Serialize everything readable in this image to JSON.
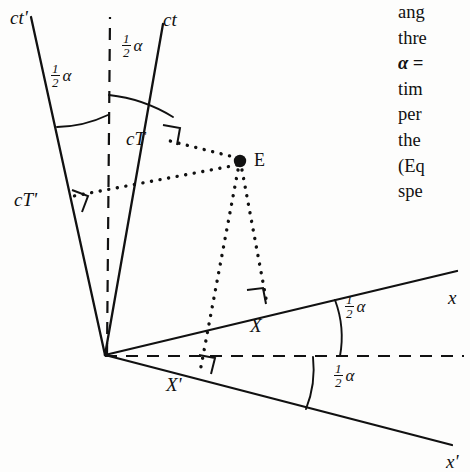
{
  "figure": {
    "name": "minkowski-spacetime-diagram",
    "ink_color": "#111111",
    "background_color": "#fdfdfc"
  },
  "axes": [
    {
      "id": "ct-prime",
      "label": "ct'",
      "x": 18,
      "y": 20
    },
    {
      "id": "ct",
      "label": "ct",
      "x": 168,
      "y": 22
    },
    {
      "id": "x",
      "label": "x",
      "x": 449,
      "y": 299
    },
    {
      "id": "x-prime",
      "label": "x'",
      "x": 449,
      "y": 463
    }
  ],
  "segments": [
    {
      "id": "cT",
      "label": "cT",
      "x": 128,
      "y": 139
    },
    {
      "id": "cT-prime",
      "label": "cT'",
      "x": 16,
      "y": 201
    },
    {
      "id": "X",
      "label": "X",
      "x": 253,
      "y": 327
    },
    {
      "id": "X-prime",
      "label": "X'",
      "x": 169,
      "y": 386
    }
  ],
  "event": {
    "id": "E",
    "label": "E",
    "dot_x": 240,
    "dot_y": 161,
    "label_x": 254,
    "label_y": 152
  },
  "angles": [
    {
      "id": "half-alpha-ct-prime",
      "numerator": "1",
      "denominator": "2",
      "symbol": "α",
      "x": 55,
      "y": 72
    },
    {
      "id": "half-alpha-ct",
      "numerator": "1",
      "denominator": "2",
      "symbol": "α",
      "x": 126,
      "y": 42
    },
    {
      "id": "half-alpha-x",
      "numerator": "1",
      "denominator": "2",
      "symbol": "α",
      "x": 349,
      "y": 303
    },
    {
      "id": "half-alpha-x-prime",
      "numerator": "1",
      "denominator": "2",
      "symbol": "α",
      "x": 338,
      "y": 372
    }
  ],
  "text_column": {
    "lines": [
      {
        "id": "line-1",
        "text": "ang",
        "bold": false
      },
      {
        "id": "line-2",
        "text": "thre",
        "bold": false
      },
      {
        "id": "line-3",
        "text": "α =",
        "bold": true
      },
      {
        "id": "line-4",
        "text": "tim",
        "bold": false
      },
      {
        "id": "line-5",
        "text": "per",
        "bold": false
      },
      {
        "id": "line-6",
        "text": "the",
        "bold": false
      },
      {
        "id": "line-7",
        "text": "(Eq",
        "bold": false
      },
      {
        "id": "line-8",
        "text": "spe",
        "bold": false
      }
    ]
  },
  "geometry": {
    "origin": {
      "x": 105,
      "y": 355
    },
    "lines": {
      "ct_prime_end": {
        "x": 30,
        "y": 18
      },
      "ct_end": {
        "x": 162,
        "y": 26
      },
      "bisector_end": {
        "x": 109,
        "y": 18
      },
      "x_end": {
        "x": 455,
        "y": 272
      },
      "x_prime_end": {
        "x": 450,
        "y": 444
      },
      "h_dash_end": {
        "x": 462,
        "y": 356
      }
    }
  }
}
